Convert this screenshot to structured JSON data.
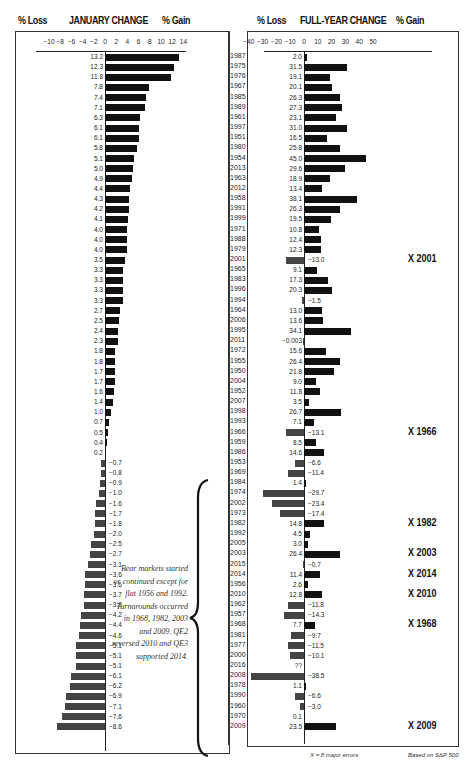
{
  "headers": {
    "left": {
      "loss": "% Loss",
      "title": "JANUARY CHANGE",
      "gain": "% Gain"
    },
    "right": {
      "loss": "% Loss",
      "title": "FULL-YEAR CHANGE",
      "gain": "% Gain"
    }
  },
  "footer": {
    "legend": "X = 8 major errors",
    "source": "Based on S&P 500"
  },
  "note": "Bear markets started or continued except for flat 1956 and 1992. Turnarounds occurred in 1968, 1982, 2003 and 2009. QE2 reversed 2010 and QE3 supported 2014.",
  "markers": [
    {
      "label": "X 2001",
      "year": "2001"
    },
    {
      "label": "X 1966",
      "year": "1966"
    },
    {
      "label": "X 1982",
      "year": "1982"
    },
    {
      "label": "X 2003",
      "year": "2003"
    },
    {
      "label": "X 2014",
      "year": "2014"
    },
    {
      "label": "X 2010",
      "year": "2010"
    },
    {
      "label": "X 1968",
      "year": "1968"
    },
    {
      "label": "X 2009",
      "year": "2009"
    }
  ],
  "colors": {
    "bar": "#111111",
    "neg_bar": "#444444",
    "text": "#222222"
  },
  "chart_data": [
    {
      "type": "bar",
      "orientation": "horizontal",
      "title": "JANUARY CHANGE",
      "xlabel_left": "% Loss",
      "xlabel_right": "% Gain",
      "xticks": [
        -10,
        -8,
        -6,
        -4,
        -2,
        0,
        2,
        4,
        6,
        8,
        10,
        12,
        14
      ],
      "xlim": [
        -10,
        14
      ],
      "categories": [
        "1987",
        "1975",
        "1976",
        "1967",
        "1985",
        "1989",
        "1961",
        "1997",
        "1951",
        "1980",
        "1954",
        "2013",
        "1963",
        "2012",
        "1958",
        "1991",
        "1999",
        "1971",
        "1988",
        "1979",
        "2001",
        "1965",
        "1983",
        "1996",
        "1994",
        "1964",
        "2006",
        "1995",
        "2011",
        "1972",
        "1955",
        "1950",
        "2004",
        "1952",
        "2007",
        "1998",
        "1993",
        "1966",
        "1959",
        "1986",
        "1953",
        "1969",
        "1984",
        "1974",
        "2002",
        "1973",
        "1982",
        "1992",
        "2005",
        "2003",
        "2015",
        "2014",
        "1956",
        "2010",
        "1962",
        "1957",
        "1968",
        "1981",
        "1977",
        "2000",
        "2016",
        "2008",
        "1978",
        "1990",
        "1960",
        "1970",
        "2009"
      ],
      "values": [
        13.2,
        12.3,
        11.8,
        7.8,
        7.4,
        7.1,
        6.3,
        6.1,
        6.1,
        5.8,
        5.1,
        5.0,
        4.9,
        4.4,
        4.3,
        4.2,
        4.1,
        4.0,
        4.0,
        4.0,
        3.5,
        3.3,
        3.3,
        3.3,
        3.3,
        2.7,
        2.5,
        2.4,
        2.3,
        1.8,
        1.8,
        1.7,
        1.7,
        1.6,
        1.4,
        1.0,
        0.7,
        0.5,
        0.4,
        0.2,
        -0.7,
        -0.8,
        -0.9,
        -1.0,
        -1.6,
        -1.7,
        -1.8,
        -2.0,
        -2.5,
        -2.7,
        -3.1,
        -3.6,
        -3.6,
        -3.7,
        -3.8,
        -4.2,
        -4.4,
        -4.6,
        -5.1,
        -5.1,
        -5.1,
        -6.1,
        -6.2,
        -6.9,
        -7.1,
        -7.6,
        -8.6
      ],
      "labels": [
        "13.2",
        "12.3",
        "11.8",
        "7.8",
        "7.4",
        "7.1",
        "6.3",
        "6.1",
        "6.1",
        "5.8",
        "5.1",
        "5.0",
        "4.9",
        "4.4",
        "4.3",
        "4.2",
        "4.1",
        "4.0",
        "4.0",
        "4.0",
        "3.5",
        "3.3",
        "3.3",
        "3.3",
        "3.3",
        "2.7",
        "2.5",
        "2.4",
        "2.3",
        "1.8",
        "1.8",
        "1.7",
        "1.7",
        "1.6",
        "1.4",
        "1.0",
        "0.7",
        "0.5",
        "0.4",
        "0.2",
        "−0.7",
        "−0.8",
        "−0.9",
        "−1.0",
        "−1.6",
        "−1.7",
        "−1.8",
        "−2.0",
        "−2.5",
        "−2.7",
        "−3.1",
        "−3.6",
        "−3.6",
        "−3.7",
        "−3.8",
        "−4.2",
        "−4.4",
        "−4.6",
        "−5.1",
        "−5.1",
        "−5.1",
        "−6.1",
        "−6.2",
        "−6.9",
        "−7.1",
        "−7.6",
        "−8.6"
      ],
      "grid": false
    },
    {
      "type": "bar",
      "orientation": "horizontal",
      "title": "FULL-YEAR CHANGE",
      "xlabel_left": "% Loss",
      "xlabel_right": "% Gain",
      "xticks": [
        -40,
        -30,
        -20,
        -10,
        0,
        10,
        20,
        30,
        40,
        50
      ],
      "xlim": [
        -40,
        50
      ],
      "categories": [
        "1987",
        "1975",
        "1976",
        "1967",
        "1985",
        "1989",
        "1961",
        "1997",
        "1951",
        "1980",
        "1954",
        "2013",
        "1963",
        "2012",
        "1958",
        "1991",
        "1999",
        "1971",
        "1988",
        "1979",
        "2001",
        "1965",
        "1983",
        "1996",
        "1994",
        "1964",
        "2006",
        "1995",
        "2011",
        "1972",
        "1955",
        "1950",
        "2004",
        "1952",
        "2007",
        "1998",
        "1993",
        "1966",
        "1959",
        "1986",
        "1953",
        "1969",
        "1984",
        "1974",
        "2002",
        "1973",
        "1982",
        "1992",
        "2005",
        "2003",
        "2015",
        "2014",
        "1956",
        "2010",
        "1962",
        "1957",
        "1968",
        "1981",
        "1977",
        "2000",
        "2016",
        "2008",
        "1978",
        "1990",
        "1960",
        "1970",
        "2009"
      ],
      "values": [
        2.0,
        31.5,
        19.1,
        20.1,
        26.3,
        27.3,
        23.1,
        31.0,
        16.5,
        25.8,
        45.0,
        29.6,
        18.9,
        13.4,
        38.1,
        26.3,
        19.5,
        10.8,
        12.4,
        12.3,
        -13.0,
        9.1,
        17.3,
        20.3,
        -1.5,
        13.0,
        13.6,
        34.1,
        -0.003,
        15.6,
        26.4,
        21.8,
        9.0,
        11.8,
        3.5,
        26.7,
        7.1,
        -13.1,
        8.5,
        14.6,
        -6.6,
        -11.4,
        1.4,
        -29.7,
        -23.4,
        -17.4,
        14.8,
        4.5,
        3.0,
        26.4,
        -0.7,
        11.4,
        2.6,
        12.8,
        -11.8,
        -14.3,
        7.7,
        -9.7,
        -11.5,
        -10.1,
        null,
        -38.5,
        1.1,
        -6.6,
        -3.0,
        0.1,
        23.5
      ],
      "labels": [
        "2.0",
        "31.5",
        "19.1",
        "20.1",
        "26.3",
        "27.3",
        "23.1",
        "31.0",
        "16.5",
        "25.8",
        "45.0",
        "29.6",
        "18.9",
        "13.4",
        "38.1",
        "26.3",
        "19.5",
        "10.8",
        "12.4",
        "12.3",
        "−13.0",
        "9.1",
        "17.3",
        "20.3",
        "−1.5",
        "13.0",
        "13.6",
        "34.1",
        "−0.003",
        "15.6",
        "26.4",
        "21.8",
        "9.0",
        "11.8",
        "3.5",
        "26.7",
        "7.1",
        "−13.1",
        "8.5",
        "14.6",
        "−6.6",
        "−11.4",
        "1.4",
        "−29.7",
        "−23.4",
        "−17.4",
        "14.8",
        "4.5",
        "3.0",
        "26.4",
        "−0.7",
        "11.4",
        "2.6",
        "12.8",
        "−11.8",
        "−14.3",
        "7.7",
        "−9.7",
        "−11.5",
        "−10.1",
        "??",
        "−38.5",
        "1.1",
        "−6.6",
        "−3.0",
        "0.1",
        "23.5"
      ],
      "grid": false
    }
  ]
}
